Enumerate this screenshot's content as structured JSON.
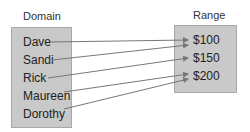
{
  "domain": {
    "title": "Domain",
    "items": [
      "Dave",
      "Sandi",
      "Rick",
      "Maureen",
      "Dorothy"
    ]
  },
  "range": {
    "title": "Range",
    "items": [
      "$100",
      "$150",
      "$200"
    ]
  },
  "mappings": [
    {
      "from": "Dave",
      "to": "$100"
    },
    {
      "from": "Sandi",
      "to": "$100"
    },
    {
      "from": "Rick",
      "to": "$150"
    },
    {
      "from": "Maureen",
      "to": "$200"
    },
    {
      "from": "Dorothy",
      "to": "$200"
    }
  ],
  "colors": {
    "box_fill": "#c9c9c9",
    "arrow": "#777777"
  }
}
